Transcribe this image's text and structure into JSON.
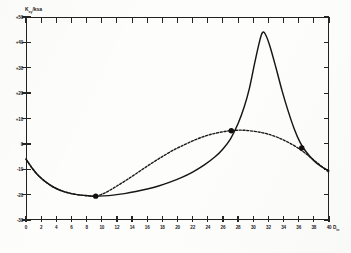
{
  "figure": {
    "y_axis_title": "K",
    "y_axis_title_sub": "xy",
    "y_axis_title_unit": "/ksa",
    "x_axis_unit": "D",
    "x_axis_unit_sub": "in"
  },
  "chart_data": {
    "type": "line",
    "title": "",
    "xlabel": "",
    "ylabel": "Kxy/ksa",
    "xlim": [
      0,
      40
    ],
    "ylim": [
      -30,
      50
    ],
    "grid": false,
    "legend": "none",
    "xticks": [
      0,
      2,
      4,
      6,
      8,
      10,
      12,
      14,
      16,
      18,
      20,
      22,
      24,
      26,
      28,
      30,
      32,
      34,
      36,
      38,
      40
    ],
    "xticklabels": [
      "0",
      "2",
      "4",
      "6",
      "8",
      "10",
      "12",
      "14",
      "16",
      "18",
      "20",
      "22",
      "24",
      "26",
      "28",
      "30",
      "32",
      "34",
      "36",
      "38",
      "40"
    ],
    "yticks": [
      -30,
      -20,
      -10,
      0,
      10,
      20,
      30,
      40,
      50
    ],
    "yticklabels": [
      "-30",
      "-20",
      "-10",
      "0",
      "+10",
      "+20",
      "+30",
      "+40",
      "+50"
    ],
    "series": [
      {
        "name": "solid-curve",
        "style": "solid",
        "points": [
          [
            0.0,
            -6.0
          ],
          [
            0.8,
            -9.5
          ],
          [
            1.6,
            -12.4
          ],
          [
            2.6,
            -15.0
          ],
          [
            3.6,
            -17.0
          ],
          [
            4.8,
            -18.6
          ],
          [
            6.0,
            -19.6
          ],
          [
            7.2,
            -20.2
          ],
          [
            8.4,
            -20.5
          ],
          [
            9.2,
            -20.6
          ],
          [
            10.2,
            -20.5
          ],
          [
            11.5,
            -20.2
          ],
          [
            13.0,
            -19.6
          ],
          [
            14.5,
            -18.8
          ],
          [
            16.0,
            -17.8
          ],
          [
            17.5,
            -16.6
          ],
          [
            19.0,
            -15.1
          ],
          [
            20.5,
            -13.3
          ],
          [
            22.0,
            -11.1
          ],
          [
            23.5,
            -8.4
          ],
          [
            25.0,
            -5.0
          ],
          [
            26.0,
            -2.0
          ],
          [
            27.0,
            2.0
          ],
          [
            28.0,
            8.0
          ],
          [
            28.8,
            14.5
          ],
          [
            29.5,
            22.0
          ],
          [
            30.2,
            32.0
          ],
          [
            30.8,
            40.0
          ],
          [
            31.2,
            43.8
          ],
          [
            31.6,
            43.2
          ],
          [
            32.2,
            38.5
          ],
          [
            33.0,
            30.0
          ],
          [
            33.8,
            21.0
          ],
          [
            34.6,
            13.0
          ],
          [
            35.4,
            6.0
          ],
          [
            36.2,
            0.5
          ],
          [
            37.0,
            -3.2
          ],
          [
            38.0,
            -6.6
          ],
          [
            39.0,
            -9.0
          ],
          [
            40.0,
            -10.6
          ]
        ]
      },
      {
        "name": "dashed-curve",
        "style": "dashed",
        "points": [
          [
            0.0,
            -6.0
          ],
          [
            0.8,
            -9.5
          ],
          [
            1.6,
            -12.4
          ],
          [
            2.6,
            -15.0
          ],
          [
            3.6,
            -17.0
          ],
          [
            4.8,
            -18.6
          ],
          [
            6.0,
            -19.6
          ],
          [
            7.2,
            -20.2
          ],
          [
            8.4,
            -20.5
          ],
          [
            9.2,
            -20.6
          ],
          [
            10.5,
            -19.2
          ],
          [
            12.0,
            -16.6
          ],
          [
            13.5,
            -13.8
          ],
          [
            15.0,
            -10.8
          ],
          [
            16.5,
            -7.8
          ],
          [
            18.0,
            -5.0
          ],
          [
            19.5,
            -2.4
          ],
          [
            21.0,
            -0.2
          ],
          [
            22.5,
            1.8
          ],
          [
            24.0,
            3.4
          ],
          [
            25.5,
            4.5
          ],
          [
            27.0,
            5.2
          ],
          [
            28.5,
            5.4
          ],
          [
            30.0,
            5.0
          ],
          [
            31.5,
            4.2
          ],
          [
            33.0,
            2.8
          ],
          [
            34.5,
            0.8
          ],
          [
            36.0,
            -1.8
          ],
          [
            37.0,
            -4.0
          ],
          [
            38.0,
            -6.4
          ],
          [
            39.0,
            -8.8
          ],
          [
            40.0,
            -11.2
          ]
        ]
      }
    ],
    "markers": [
      {
        "x": 9.2,
        "y": -20.6,
        "label": "minimum"
      },
      {
        "x": 27.1,
        "y": 5.2,
        "label": "crossing"
      },
      {
        "x": 36.4,
        "y": -1.6,
        "label": "second-crossing"
      }
    ]
  }
}
